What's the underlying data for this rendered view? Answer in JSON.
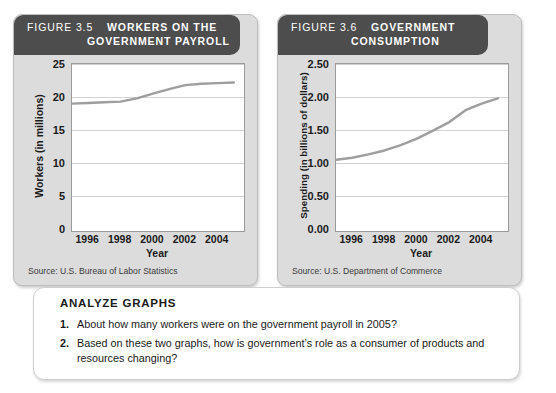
{
  "figures": [
    {
      "id": "figure-3-5",
      "header_number": "FIGURE 3.5",
      "header_line1": "WORKERS ON THE",
      "header_line2": "GOVERNMENT PAYROLL",
      "source": "Source: U.S. Bureau of Labor Statistics",
      "chart_data": {
        "type": "line",
        "title": "Workers on the Government Payroll",
        "xlabel": "Year",
        "ylabel": "Workers (in millions)",
        "xlim": [
          1995,
          2005.5
        ],
        "ylim": [
          0,
          25
        ],
        "yticks": [
          "0",
          "5",
          "10",
          "15",
          "20",
          "25"
        ],
        "ytick_values": [
          0,
          5,
          10,
          15,
          20,
          25
        ],
        "xticks": [
          "1996",
          "1998",
          "2000",
          "2002",
          "2004"
        ],
        "xtick_values": [
          1996,
          1998,
          2000,
          2002,
          2004
        ],
        "grid": true,
        "legend": "none",
        "line_color": "#9e9e9e",
        "x": [
          1995,
          1996,
          1997,
          1998,
          1999,
          2000,
          2001,
          2002,
          2003,
          2004,
          2005
        ],
        "values": [
          19.0,
          19.1,
          19.2,
          19.3,
          19.8,
          20.5,
          21.2,
          21.8,
          22.0,
          22.1,
          22.2
        ]
      }
    },
    {
      "id": "figure-3-6",
      "header_number": "FIGURE 3.6",
      "header_line1": "GOVERNMENT",
      "header_line2": "CONSUMPTION",
      "source": "Source: U.S. Department of Commerce",
      "chart_data": {
        "type": "line",
        "title": "Government Consumption",
        "xlabel": "Year",
        "ylabel": "Spending (in billions of dollars)",
        "xlim": [
          1995,
          2005.5
        ],
        "ylim": [
          0,
          2.5
        ],
        "yticks": [
          "0.00",
          "0.50",
          "1.00",
          "1.50",
          "2.00",
          "2.50"
        ],
        "ytick_values": [
          0,
          0.5,
          1.0,
          1.5,
          2.0,
          2.5
        ],
        "xticks": [
          "1996",
          "1998",
          "2000",
          "2002",
          "2004"
        ],
        "xtick_values": [
          1996,
          1998,
          2000,
          2002,
          2004
        ],
        "grid": true,
        "legend": "none",
        "line_color": "#9e9e9e",
        "x": [
          1995,
          1996,
          1997,
          1998,
          1999,
          2000,
          2001,
          2002,
          2003,
          2004,
          2005
        ],
        "values": [
          1.05,
          1.08,
          1.13,
          1.19,
          1.27,
          1.37,
          1.49,
          1.62,
          1.8,
          1.9,
          1.98
        ]
      }
    }
  ],
  "analyze": {
    "title": "ANALYZE GRAPHS",
    "questions": [
      {
        "number": "1.",
        "text": "About how many workers were on the government payroll in 2005?"
      },
      {
        "number": "2.",
        "text": "Based on these two graphs, how is government’s role as a consumer of products and resources changing?"
      }
    ]
  }
}
